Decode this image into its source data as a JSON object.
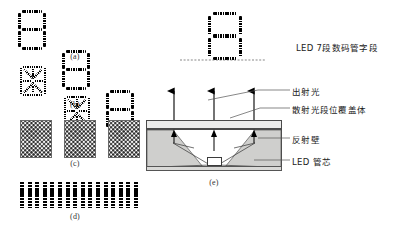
{
  "figure": {
    "panels": [
      {
        "id": "a",
        "caption": "(a)",
        "kind": "seven-segment-row",
        "count": 3,
        "digit": "8"
      },
      {
        "id": "b",
        "caption": "(b)",
        "kind": "starburst-row",
        "count": 3
      },
      {
        "id": "c",
        "caption": "(c)",
        "kind": "dot-matrix-row",
        "count": 3
      },
      {
        "id": "d",
        "caption": "(d)",
        "kind": "bar-array",
        "count": 16
      },
      {
        "id": "e",
        "caption": "(e)",
        "kind": "led-cross-section"
      }
    ],
    "top_right": {
      "digit": "8",
      "label": "LED 7段数码管字段"
    },
    "cross_section": {
      "callouts": [
        {
          "key": "emitted_light",
          "label": "出射光"
        },
        {
          "key": "diffuser_cover",
          "label": "散射光段位覆盖体"
        },
        {
          "key": "reflector_wall",
          "label": "反射壁"
        },
        {
          "key": "led_die",
          "label": "LED 管芯"
        }
      ],
      "ray_count": 3
    },
    "colors": {
      "ink": "#111111",
      "line": "#4a4a4a",
      "wall_fill": "#cfcfcd",
      "cover_fill": "#ececeb",
      "substrate_fill": "#d9d9d7",
      "background": "#ffffff"
    }
  }
}
